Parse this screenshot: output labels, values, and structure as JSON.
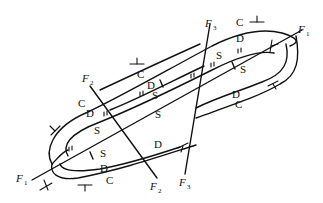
{
  "diagram": {
    "type": "geological-map",
    "faults": [
      {
        "id": "F1",
        "label": "F",
        "subscript": "1"
      },
      {
        "id": "F2",
        "label": "F",
        "subscript": "2"
      },
      {
        "id": "F3",
        "label": "F",
        "subscript": "3"
      }
    ],
    "formations": {
      "outer": "C",
      "middle": "D",
      "inner": "S"
    },
    "labels": {
      "c1": "C",
      "c2": "C",
      "c3": "C",
      "c4": "C",
      "c5": "C",
      "d1": "D",
      "d2": "D",
      "d3": "D",
      "d4": "D",
      "d5": "D",
      "d6": "D",
      "s1": "S",
      "s2": "S",
      "s3": "S",
      "s4": "S",
      "s5": "S"
    },
    "colors": {
      "line": "#111111",
      "background": "#ffffff"
    }
  }
}
